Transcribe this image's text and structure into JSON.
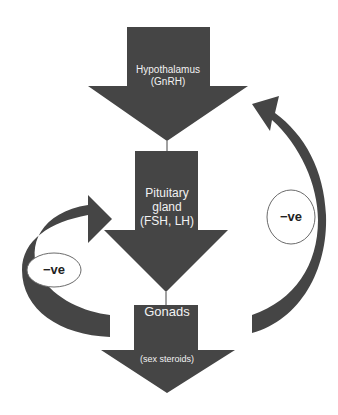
{
  "diagram": {
    "type": "flowchart",
    "colors": {
      "arrow_fill": "#454545",
      "label_text": "#f2f2f2",
      "ellipse_stroke": "#6b6b6b",
      "background": "#ffffff"
    },
    "nodes": [
      {
        "id": "hypothalamus",
        "line1": "Hypothalamus",
        "line2": "(GnRH)"
      },
      {
        "id": "pituitary",
        "line1": "Pituitary",
        "line2": "gland",
        "line3": "(FSH, LH)"
      },
      {
        "id": "gonads",
        "line1": "Gonads",
        "line2": "(sex steroids)"
      }
    ],
    "feedback": [
      {
        "id": "left-feedback",
        "label": "−ve",
        "from": "gonads",
        "to": "pituitary"
      },
      {
        "id": "right-feedback",
        "label": "−ve",
        "from": "gonads",
        "to": "hypothalamus"
      }
    ]
  }
}
